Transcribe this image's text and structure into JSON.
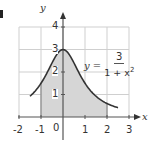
{
  "panel_marker": "3",
  "equation": {
    "lhs": "y =",
    "numerator": "3",
    "denominator_base": "1 + x",
    "denominator_exp": "2"
  },
  "colors": {
    "grid": "#cfcfcf",
    "axis": "#555555",
    "curve": "#333333",
    "shade": "#d6d6d6",
    "text": "#333333"
  },
  "chart_data": {
    "type": "area",
    "title": "",
    "function": "y = 3 / (1 + x^2)",
    "xlabel": "x",
    "ylabel": "y",
    "xlim": [
      -2,
      3
    ],
    "ylim": [
      0,
      4
    ],
    "x_ticks": [
      "-2",
      "-1",
      "0",
      "1",
      "2",
      "3"
    ],
    "y_ticks": [
      "1",
      "2",
      "3",
      "4"
    ],
    "grid": true,
    "curve_domain": [
      -1.5,
      2.5
    ],
    "shaded_interval": [
      -1,
      2
    ],
    "sample_points": [
      {
        "x": -1.5,
        "y": 0.92
      },
      {
        "x": -1,
        "y": 1.5
      },
      {
        "x": 0,
        "y": 3
      },
      {
        "x": 1,
        "y": 1.5
      },
      {
        "x": 2,
        "y": 0.6
      },
      {
        "x": 2.5,
        "y": 0.41
      }
    ]
  }
}
